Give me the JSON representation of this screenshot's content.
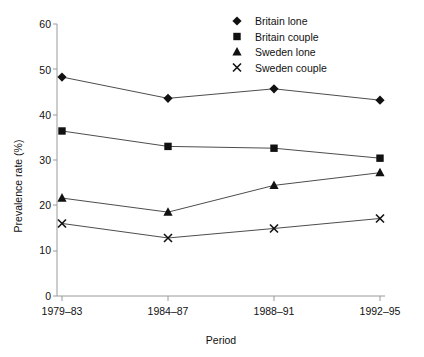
{
  "chart_data": {
    "type": "line",
    "title": "",
    "xlabel": "Period",
    "ylabel": "Prevalence rate (%)",
    "categories": [
      "1979–83",
      "1984–87",
      "1988–91",
      "1992–95"
    ],
    "ylim": [
      0,
      60
    ],
    "yticks": [
      0,
      10,
      20,
      30,
      40,
      50,
      60
    ],
    "ytick_labels": [
      "0",
      "10",
      "20",
      "30",
      "40",
      "50",
      "60"
    ],
    "grid": false,
    "legend_position": "top-right",
    "series": [
      {
        "name": "Britain lone",
        "marker": "diamond",
        "values": [
          48.3,
          43.6,
          45.7,
          43.2
        ]
      },
      {
        "name": "Britain couple",
        "marker": "square",
        "values": [
          36.4,
          33.0,
          32.6,
          30.4
        ]
      },
      {
        "name": "Sweden lone",
        "marker": "triangle",
        "values": [
          21.6,
          18.5,
          24.4,
          27.2
        ]
      },
      {
        "name": "Sweden couple",
        "marker": "cross",
        "values": [
          16.0,
          12.8,
          14.9,
          17.1
        ]
      }
    ]
  },
  "axes": {
    "y_title": "Prevalence rate (%)",
    "x_title": "Period",
    "y_ticks": [
      "60",
      "50",
      "40",
      "30",
      "20",
      "10",
      "0"
    ],
    "x_ticks": [
      "1979–83",
      "1984–87",
      "1988–91",
      "1992–95"
    ]
  },
  "legend": {
    "items": [
      {
        "label": "Britain lone",
        "marker": "diamond-marker"
      },
      {
        "label": "Britain couple",
        "marker": "square-marker"
      },
      {
        "label": "Sweden lone",
        "marker": "triangle-marker"
      },
      {
        "label": "Sweden couple",
        "marker": "cross-marker"
      }
    ]
  },
  "colors": {
    "marker": "#111111",
    "line": "#4d4d4d",
    "axis": "#9a9a9a",
    "text": "#111111",
    "background": "#ffffff"
  }
}
